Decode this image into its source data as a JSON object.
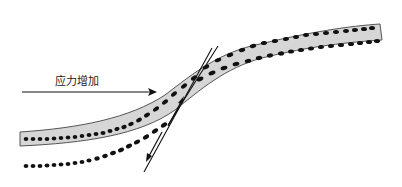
{
  "diagram": {
    "title": "",
    "labels": {
      "stress_arrow": "应力增加"
    },
    "colors": {
      "band_fill": "#d6d6d6",
      "band_stroke": "#555555",
      "dots": "#111111",
      "fault": "#111111",
      "arrow": "#111111"
    },
    "elements": [
      {
        "id": "upper-layer-band",
        "type": "curved-band",
        "description": "grey strip with row of dots, bends down from upper right to lower left"
      },
      {
        "id": "lower-dotted-row",
        "type": "dotted-curve",
        "description": "row of dots beneath the band, offset across fault"
      },
      {
        "id": "stress-arrow",
        "type": "arrow",
        "direction": "right",
        "label": "应力增加"
      },
      {
        "id": "fault-line",
        "type": "line-pair",
        "description": "two thin intersecting lines crossing the bend"
      },
      {
        "id": "slip-arrows",
        "type": "half-arrows",
        "description": "opposite slip arrows along fault: upper pointing up, lower pointing down"
      }
    ]
  }
}
